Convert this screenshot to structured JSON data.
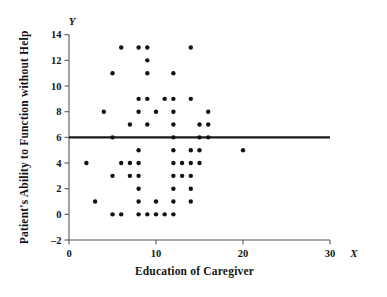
{
  "chart_data": {
    "type": "scatter",
    "title": "",
    "xlabel": "Education of Caregiver",
    "ylabel": "Patient's Ability to Function without Help",
    "x_axis_variable": "X",
    "y_axis_variable": "Y",
    "xlim": [
      0,
      30
    ],
    "ylim": [
      -2,
      14
    ],
    "xticks": [
      0,
      10,
      20,
      30
    ],
    "xtick_labels": [
      "0",
      "10",
      "20",
      "30"
    ],
    "yticks": [
      -2,
      0,
      2,
      4,
      6,
      8,
      10,
      12,
      14
    ],
    "ytick_labels": [
      "-2",
      "0",
      "2",
      "4",
      "6",
      "8",
      "10",
      "12",
      "14"
    ],
    "grid": false,
    "legend": null,
    "marker": "filled-circle",
    "marker_color": "#121212",
    "reference_line": {
      "orientation": "horizontal",
      "y": 6,
      "color": "#1b1b1b",
      "label": ""
    },
    "points": [
      {
        "x": 6,
        "y": 13
      },
      {
        "x": 8,
        "y": 13
      },
      {
        "x": 9,
        "y": 13
      },
      {
        "x": 14,
        "y": 13
      },
      {
        "x": 9,
        "y": 12
      },
      {
        "x": 5,
        "y": 11
      },
      {
        "x": 9,
        "y": 11
      },
      {
        "x": 12,
        "y": 11
      },
      {
        "x": 8,
        "y": 9
      },
      {
        "x": 9,
        "y": 9
      },
      {
        "x": 11,
        "y": 9
      },
      {
        "x": 12,
        "y": 9
      },
      {
        "x": 14,
        "y": 9
      },
      {
        "x": 4,
        "y": 8
      },
      {
        "x": 8,
        "y": 8
      },
      {
        "x": 10,
        "y": 8
      },
      {
        "x": 12,
        "y": 8
      },
      {
        "x": 16,
        "y": 8
      },
      {
        "x": 7,
        "y": 7
      },
      {
        "x": 9,
        "y": 7
      },
      {
        "x": 12,
        "y": 7
      },
      {
        "x": 15,
        "y": 7
      },
      {
        "x": 16,
        "y": 7
      },
      {
        "x": 5,
        "y": 6
      },
      {
        "x": 12,
        "y": 6
      },
      {
        "x": 15,
        "y": 6
      },
      {
        "x": 16,
        "y": 6
      },
      {
        "x": 8,
        "y": 5
      },
      {
        "x": 12,
        "y": 5
      },
      {
        "x": 14,
        "y": 5
      },
      {
        "x": 15,
        "y": 5
      },
      {
        "x": 20,
        "y": 5
      },
      {
        "x": 2,
        "y": 4
      },
      {
        "x": 6,
        "y": 4
      },
      {
        "x": 7,
        "y": 4
      },
      {
        "x": 8,
        "y": 4
      },
      {
        "x": 12,
        "y": 4
      },
      {
        "x": 13,
        "y": 4
      },
      {
        "x": 14,
        "y": 4
      },
      {
        "x": 15,
        "y": 4
      },
      {
        "x": 5,
        "y": 3
      },
      {
        "x": 7,
        "y": 3
      },
      {
        "x": 8,
        "y": 3
      },
      {
        "x": 12,
        "y": 3
      },
      {
        "x": 13,
        "y": 3
      },
      {
        "x": 14,
        "y": 3
      },
      {
        "x": 8,
        "y": 2
      },
      {
        "x": 12,
        "y": 2
      },
      {
        "x": 14,
        "y": 2
      },
      {
        "x": 3,
        "y": 1
      },
      {
        "x": 8,
        "y": 1
      },
      {
        "x": 10,
        "y": 1
      },
      {
        "x": 12,
        "y": 1
      },
      {
        "x": 14,
        "y": 1
      },
      {
        "x": 5,
        "y": 0
      },
      {
        "x": 6,
        "y": 0
      },
      {
        "x": 8,
        "y": 0
      },
      {
        "x": 9,
        "y": 0
      },
      {
        "x": 10,
        "y": 0
      },
      {
        "x": 11,
        "y": 0
      },
      {
        "x": 12,
        "y": 0
      }
    ]
  }
}
